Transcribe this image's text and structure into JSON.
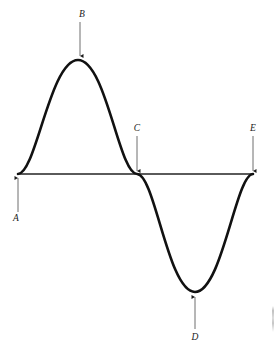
{
  "figure": {
    "width": 275,
    "height": 351,
    "background_color": "#ffffff",
    "curve_color": "#111111",
    "axis_color": "#5a5a5a",
    "label_color": "#1a1a1a",
    "curve_stroke_width": 2.6,
    "axis_stroke_width": 1.1
  },
  "chart_data": {
    "type": "line",
    "title": "",
    "xlabel": "",
    "ylabel": "",
    "grid": false,
    "legend": "none",
    "axis_line": {
      "name": "baseline",
      "y_pixel": 174,
      "x_start_pixel": 18,
      "x_end_pixel": 253,
      "color": "#5a5a5a"
    },
    "curve": {
      "name": "sine-wave",
      "description": "one full sine cycle, rising first",
      "cycles": 1,
      "phase": "starts at zero going up",
      "x_pixel_range": [
        18,
        253
      ],
      "amplitude_pixels": 115,
      "baseline_y_pixel": 174,
      "path": "M 18 174 C 36 174 50 60 78 60 C 106 60 119 174 137 174 C 155 174 168 292 195 292 C 222 292 236 174 253 174"
    },
    "points": [
      {
        "id": "A",
        "label": "A",
        "role": "start-zero-crossing-rising",
        "x_pixel": 18,
        "y_pixel": 174,
        "label_x": 16,
        "label_y": 218,
        "arrow_direction": "up",
        "arrow_from_y": 212,
        "arrow_to_y": 178
      },
      {
        "id": "B",
        "label": "B",
        "role": "crest-maximum",
        "x_pixel": 78,
        "y_pixel": 60,
        "label_x": 82,
        "label_y": 14,
        "arrow_direction": "down",
        "arrow_from_y": 22,
        "arrow_to_y": 56
      },
      {
        "id": "C",
        "label": "C",
        "role": "zero-crossing-falling",
        "x_pixel": 137,
        "y_pixel": 174,
        "label_x": 137,
        "label_y": 128,
        "arrow_direction": "down",
        "arrow_from_y": 136,
        "arrow_to_y": 171
      },
      {
        "id": "D",
        "label": "D",
        "role": "trough-minimum",
        "x_pixel": 195,
        "y_pixel": 292,
        "label_x": 195,
        "label_y": 337,
        "arrow_direction": "up",
        "arrow_from_y": 329,
        "arrow_to_y": 297
      },
      {
        "id": "E",
        "label": "E",
        "role": "end-zero-crossing-rising",
        "x_pixel": 253,
        "y_pixel": 174,
        "label_x": 253,
        "label_y": 128,
        "arrow_direction": "down",
        "arrow_from_y": 136,
        "arrow_to_y": 171
      }
    ]
  }
}
